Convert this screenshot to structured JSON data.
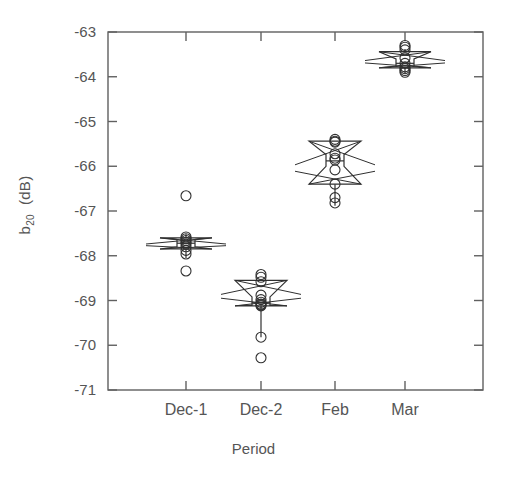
{
  "chart_data": {
    "type": "box",
    "title": "",
    "xlabel": "Period",
    "ylabel": "b20  (dB)",
    "ylabel_base": "b",
    "ylabel_sub": "20",
    "ylabel_unit": "(dB)",
    "categories": [
      "Dec-1",
      "Dec-2",
      "Feb",
      "Mar"
    ],
    "xtick_labels": [
      "Dec-1",
      "Dec-2",
      "Feb",
      "Mar"
    ],
    "ytick_labels": [
      "-63",
      "-64",
      "-65",
      "-66",
      "-67",
      "-68",
      "-69",
      "-70",
      "-71"
    ],
    "ytick_values": [
      -63,
      -64,
      -65,
      -66,
      -67,
      -68,
      -69,
      -70,
      -71
    ],
    "ylim": [
      -71,
      -63
    ],
    "xlim": [
      0,
      5
    ],
    "grid": false,
    "legend": null,
    "notched": true,
    "box_style": "notched-bowtie",
    "series": [
      {
        "name": "Dec-1",
        "x": 1,
        "median": -67.72,
        "q1": -67.85,
        "q3": -67.6,
        "notch_low": -67.8,
        "notch_high": -67.64,
        "whisker_low": -68.05,
        "whisker_high": -67.52,
        "points": [
          -66.66,
          -67.58,
          -67.62,
          -67.66,
          -67.7,
          -67.74,
          -67.8,
          -67.88,
          -67.96,
          -68.34
        ]
      },
      {
        "name": "Dec-2",
        "x": 2,
        "median": -69.05,
        "q1": -69.12,
        "q3": -68.55,
        "notch_low": -69.1,
        "notch_high": -68.92,
        "whisker_low": -69.82,
        "whisker_high": -68.55,
        "points": [
          -68.42,
          -68.48,
          -68.58,
          -68.88,
          -68.98,
          -69.04,
          -69.08,
          -69.1,
          -69.12,
          -69.82,
          -70.28
        ]
      },
      {
        "name": "Feb",
        "x": 3,
        "median": -65.88,
        "q1": -66.4,
        "q3": -65.44,
        "notch_low": -66.0,
        "notch_high": -65.74,
        "whisker_low": -66.88,
        "whisker_high": -65.44,
        "points": [
          -65.4,
          -65.44,
          -65.46,
          -65.72,
          -65.82,
          -65.86,
          -66.08,
          -66.4,
          -66.7,
          -66.82
        ]
      },
      {
        "name": "Mar",
        "x": 4,
        "median": -63.7,
        "q1": -63.8,
        "q3": -63.44,
        "notch_low": -63.76,
        "notch_high": -63.6,
        "whisker_low": -63.92,
        "whisker_high": -63.38,
        "points": [
          -63.3,
          -63.34,
          -63.4,
          -63.58,
          -63.7,
          -63.78,
          -63.82,
          -63.86,
          -63.9
        ]
      }
    ]
  },
  "colors": {
    "axis": "#606060",
    "text": "#555555",
    "marker": "#303030",
    "box": "#303030"
  },
  "geometry": {
    "plot_left": 108,
    "plot_right": 483,
    "plot_top": 32,
    "plot_bottom": 390,
    "group_centers": [
      186,
      261,
      335,
      405
    ],
    "box_half_width": 26,
    "notch_half_width": 9,
    "marker_radius": 5
  }
}
